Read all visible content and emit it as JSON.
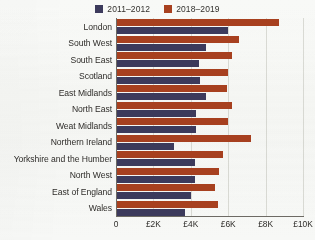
{
  "legend": {
    "items": [
      {
        "label": "2011–2012",
        "color": "#3c3a5c",
        "icon": "square-swatch-icon"
      },
      {
        "label": "2018–2019",
        "color": "#a8401f",
        "icon": "square-swatch-icon"
      }
    ]
  },
  "axis": {
    "x_ticks": [
      "0",
      "£2K",
      "£4K",
      "£6K",
      "£8K",
      "£10K"
    ],
    "x_tick_values": [
      0,
      2000,
      4000,
      6000,
      8000,
      10000
    ],
    "xmin": 0,
    "xmax": 10000
  },
  "chart_data": {
    "type": "bar",
    "orientation": "horizontal",
    "title": "",
    "subtitle": "",
    "xlabel": "",
    "ylabel": "",
    "xlim": [
      0,
      10000
    ],
    "grid": true,
    "legend_position": "top-center",
    "categories": [
      "London",
      "South West",
      "South East",
      "Scotland",
      "East Midlands",
      "North East",
      "Weat Midlands",
      "Northern Ireland",
      "Yorkshire and the Humber",
      "North West",
      "East of England",
      "Wales"
    ],
    "series": [
      {
        "name": "2011–2012",
        "color": "#3c3a5c",
        "values": [
          6000,
          4800,
          4450,
          4500,
          4800,
          4300,
          4300,
          3100,
          4250,
          4200,
          4000,
          3700
        ]
      },
      {
        "name": "2018–2019",
        "color": "#a8401f",
        "values": [
          8700,
          6600,
          6200,
          6000,
          5950,
          6200,
          6000,
          7200,
          5700,
          5500,
          5300,
          5450
        ]
      }
    ]
  }
}
